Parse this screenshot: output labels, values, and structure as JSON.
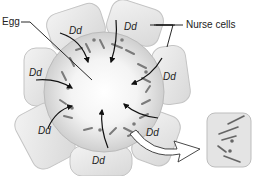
{
  "diagram": {
    "labels": {
      "egg": "Egg",
      "nurse_cells": "Nurse cells"
    },
    "nurse_cells": [
      {
        "genotype": "Dd"
      },
      {
        "genotype": "Dd"
      },
      {
        "genotype": "Dd"
      },
      {
        "genotype": "Dd"
      },
      {
        "genotype": "Dd"
      },
      {
        "genotype": "Dd"
      },
      {
        "genotype": "Dd"
      }
    ],
    "colors": {
      "cell_fill": "#e6e6e6",
      "cell_stroke": "#bdbdbd",
      "egg_fill": "#dcdcdc",
      "arrow": "#111111",
      "background": "#ffffff"
    }
  }
}
